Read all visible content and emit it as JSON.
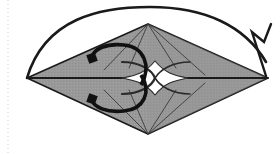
{
  "figure": {
    "caption": "Flattened square base with central star opening and two rotation arrows plus a fold-over arc",
    "canvas": {
      "width": 280,
      "height": 154,
      "background": "#ffffff"
    }
  },
  "colors": {
    "paper_fill": "#999999",
    "paper_fill_shadow": "#8e8e8e",
    "outline": "#1a1a1a",
    "crease": "#3a3a3a",
    "arrow": "#111111",
    "background": "#ffffff",
    "margin_rule": "#cfcfcf"
  },
  "margin_rule": {
    "name": "dotted-page-margin",
    "x": 8,
    "y_top": 0,
    "y_bottom": 154,
    "dash": "1 3"
  },
  "shape": {
    "name": "paper-body",
    "type": "rhombus",
    "vertices": {
      "left": {
        "x": 27,
        "y": 78
      },
      "top": {
        "x": 148,
        "y": 24
      },
      "right": {
        "x": 268,
        "y": 78
      },
      "bottom": {
        "x": 148,
        "y": 134
      }
    }
  },
  "center_star": {
    "name": "center-opening",
    "cx": 155,
    "cy": 78,
    "rx": 33,
    "ry": 17,
    "fill": "#ffffff"
  },
  "creases": [
    {
      "name": "crease-top-left-outer",
      "x1": 148,
      "y1": 24,
      "x2": 104,
      "y2": 70
    },
    {
      "name": "crease-top-left-inner",
      "x1": 148,
      "y1": 24,
      "x2": 129,
      "y2": 68
    },
    {
      "name": "crease-top-right-inner",
      "x1": 148,
      "y1": 24,
      "x2": 176,
      "y2": 68
    },
    {
      "name": "crease-top-right-outer",
      "x1": 148,
      "y1": 24,
      "x2": 205,
      "y2": 75
    },
    {
      "name": "crease-bottom-left-outer",
      "x1": 148,
      "y1": 134,
      "x2": 104,
      "y2": 90
    },
    {
      "name": "crease-bottom-left-inner",
      "x1": 148,
      "y1": 134,
      "x2": 129,
      "y2": 90
    },
    {
      "name": "crease-bottom-right-inner",
      "x1": 148,
      "y1": 134,
      "x2": 176,
      "y2": 90
    },
    {
      "name": "crease-bottom-right-outer",
      "x1": 148,
      "y1": 134,
      "x2": 205,
      "y2": 83
    }
  ],
  "arrows": {
    "rotate_top": {
      "name": "rotate-arrow-top",
      "label": "counter-clockwise rotate top flap",
      "path": "M 141 85 C 152 66 144 47 124 45 C 106 43 94 49 92 57",
      "head": {
        "x": 92,
        "y": 58,
        "rotation": -110
      },
      "stroke_width": 3.6
    },
    "rotate_bottom": {
      "name": "rotate-arrow-bottom",
      "label": "clockwise rotate bottom flap",
      "path": "M 141 75 C 152 92 144 109 124 111 C 106 113 94 107 92 100",
      "head": {
        "x": 92,
        "y": 99,
        "rotation": 110
      },
      "stroke_width": 3.6
    },
    "fold_over": {
      "name": "fold-over-arc-arrow",
      "label": "fold left point over to right point",
      "path": "M 27 78 C 45 18 100 7 150 7 C 205 7 245 26 266 62",
      "head_points": "266,76 252,32 264,42 271,24",
      "stroke_width": 2.6
    }
  },
  "accessibility": {
    "alt": "Gray rhombus-shaped folded paper with a white four-pointed star opening at center, two curved rotation arrows on the left half, and a large arc arrow sweeping from the left point over the top to the right point."
  }
}
